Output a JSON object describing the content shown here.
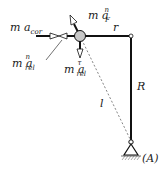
{
  "diagram": {
    "labels": {
      "m_a_cor": {
        "base": "m a",
        "sub": "cor"
      },
      "m_a_rel_n": {
        "base": "m a",
        "sup": "n",
        "sub": "rel"
      },
      "m_a_F_n": {
        "base": "m a",
        "sup": "n",
        "sub": "F"
      },
      "m_a_rel_t": {
        "base": "m a",
        "sup": "τ",
        "sub": "rel"
      },
      "r": "r",
      "R": "R",
      "l": "l",
      "A": "(A)"
    },
    "colors": {
      "line": "#111111",
      "ball": "#c8c8c8",
      "dashed": "#666666"
    }
  }
}
